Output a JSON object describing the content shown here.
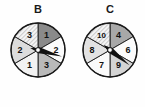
{
  "figure": {
    "type": "probability-spinners-illustration",
    "background_color": "#fefefe",
    "canvas": {
      "width": 145,
      "height": 107
    }
  },
  "spinners": [
    {
      "id": "spinner-b",
      "label": "B",
      "label_x": 38,
      "label_y": 4,
      "center_x": 38,
      "center_y": 50,
      "radius": 27,
      "sector_count": 6,
      "outline_color": "#1a1a1a",
      "pointer_angle_deg": 15,
      "pointer_color": "#111111",
      "sectors": [
        {
          "value": "1",
          "start_deg": -90,
          "end_deg": -30,
          "fill": "#8a8a8a",
          "pattern": "solid",
          "label_angle_deg": -60,
          "label_radius": 17
        },
        {
          "value": "2",
          "start_deg": -30,
          "end_deg": 30,
          "fill": "#fbfbfb",
          "pattern": "solid",
          "label_angle_deg": 0,
          "label_radius": 18
        },
        {
          "value": "3",
          "start_deg": 30,
          "end_deg": 90,
          "fill": "#b9b9b9",
          "pattern": "solid",
          "label_angle_deg": 60,
          "label_radius": 17
        },
        {
          "value": "1",
          "start_deg": 90,
          "end_deg": 150,
          "fill": "#f2f2f2",
          "pattern": "solid",
          "label_angle_deg": 120,
          "label_radius": 17
        },
        {
          "value": "2",
          "start_deg": 150,
          "end_deg": 210,
          "fill": "#dcdcdc",
          "pattern": "solid",
          "label_angle_deg": 180,
          "label_radius": 18
        },
        {
          "value": "3",
          "start_deg": 210,
          "end_deg": 270,
          "fill": "#ededed",
          "pattern": "hatch",
          "label_angle_deg": 240,
          "label_radius": 17
        }
      ]
    },
    {
      "id": "spinner-c",
      "label": "C",
      "label_x": 110,
      "label_y": 4,
      "center_x": 110,
      "center_y": 50,
      "radius": 27,
      "sector_count": 6,
      "outline_color": "#1a1a1a",
      "pointer_angle_deg": 38,
      "pointer_color": "#111111",
      "sectors": [
        {
          "value": "4",
          "start_deg": -90,
          "end_deg": -30,
          "fill": "#a8a8a8",
          "pattern": "solid",
          "label_angle_deg": -60,
          "label_radius": 17
        },
        {
          "value": "6",
          "start_deg": -30,
          "end_deg": 30,
          "fill": "#fbfbfb",
          "pattern": "solid",
          "label_angle_deg": 0,
          "label_radius": 18
        },
        {
          "value": "9",
          "start_deg": 30,
          "end_deg": 90,
          "fill": "#d4d4d4",
          "pattern": "solid",
          "label_angle_deg": 60,
          "label_radius": 17
        },
        {
          "value": "7",
          "start_deg": 90,
          "end_deg": 150,
          "fill": "#fafafa",
          "pattern": "solid",
          "label_angle_deg": 120,
          "label_radius": 17
        },
        {
          "value": "8",
          "start_deg": 150,
          "end_deg": 210,
          "fill": "#e2e2e2",
          "pattern": "solid",
          "label_angle_deg": 180,
          "label_radius": 18
        },
        {
          "value": "10",
          "start_deg": 210,
          "end_deg": 270,
          "fill": "#f0f0f0",
          "pattern": "hatch",
          "label_angle_deg": 240,
          "label_radius": 17
        }
      ]
    }
  ]
}
